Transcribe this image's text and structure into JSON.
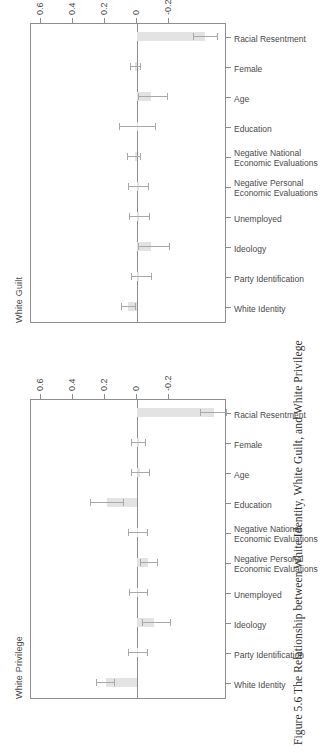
{
  "caption": "Figure 5.6 The Relationship between White Identity, White Guilt, and White Privilege",
  "axis": {
    "ticks": [
      "-0.2",
      "0",
      "0.2",
      "0.4",
      "0.6"
    ],
    "tick_values": [
      -0.2,
      0,
      0.2,
      0.4,
      0.6
    ],
    "ymin": -0.56,
    "ymax": 0.66
  },
  "categories": [
    "White Identity",
    "Party Identification",
    "Ideology",
    "Unemployed",
    "Negative Personal|Economic Evaluations",
    "Negative National|Economic Evaluations",
    "Education",
    "Age",
    "Female",
    "Racial Resentment"
  ],
  "chart_data": {
    "type": "bar",
    "title": "Figure 5.6 The Relationship between White Identity, White Guilt, and White Privilege",
    "xlabel": "",
    "ylabel": "",
    "ylim": [
      -0.56,
      0.66
    ],
    "grid": false,
    "legend": "none",
    "yticks": [
      -0.2,
      0,
      0.2,
      0.4,
      0.6
    ],
    "categories": [
      "White Identity",
      "Party Identification",
      "Ideology",
      "Unemployed",
      "Negative Personal Economic Evaluations",
      "Negative National Economic Evaluations",
      "Education",
      "Age",
      "Female",
      "Racial Resentment"
    ],
    "panels": [
      {
        "name": "White Privilege",
        "values": [
          0.195,
          -0.005,
          -0.105,
          -0.005,
          -0.07,
          -0.005,
          0.19,
          -0.02,
          -0.01,
          -0.48
        ],
        "ci_low": [
          0.145,
          -0.065,
          -0.205,
          -0.06,
          -0.125,
          -0.065,
          0.085,
          -0.075,
          -0.05,
          -0.555
        ],
        "ci_high": [
          0.255,
          0.055,
          -0.03,
          0.05,
          -0.02,
          0.055,
          0.295,
          0.035,
          0.035,
          -0.39
        ]
      },
      {
        "name": "White Guilt",
        "values": [
          0.055,
          -0.015,
          -0.085,
          -0.01,
          -0.01,
          0.015,
          0.0,
          -0.09,
          0.01,
          -0.425
        ],
        "ci_low": [
          0.01,
          -0.085,
          -0.2,
          -0.075,
          -0.07,
          -0.02,
          -0.11,
          -0.185,
          -0.02,
          -0.5
        ],
        "ci_high": [
          0.1,
          0.035,
          -0.005,
          0.05,
          0.055,
          0.06,
          0.115,
          -0.005,
          0.045,
          -0.35
        ]
      }
    ]
  }
}
